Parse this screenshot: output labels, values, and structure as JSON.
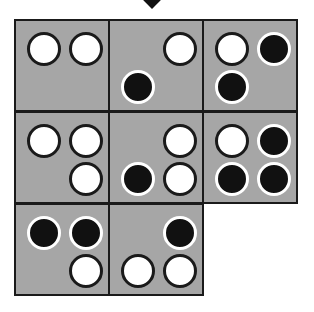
{
  "diagram": {
    "arrow": "down-arrow-icon",
    "colors": {
      "cell_bg": "#a6a6a6",
      "border": "#1a1a1a",
      "white_dot": "#ffffff",
      "black_dot": "#111111"
    },
    "cells": [
      {
        "row": 0,
        "col": 0,
        "dots": [
          {
            "pos": "tl",
            "color": "white"
          },
          {
            "pos": "tr",
            "color": "white"
          }
        ]
      },
      {
        "row": 0,
        "col": 1,
        "dots": [
          {
            "pos": "tr",
            "color": "white"
          },
          {
            "pos": "bl",
            "color": "black"
          }
        ]
      },
      {
        "row": 0,
        "col": 2,
        "dots": [
          {
            "pos": "tl",
            "color": "white"
          },
          {
            "pos": "tr",
            "color": "black"
          },
          {
            "pos": "bl",
            "color": "black"
          }
        ]
      },
      {
        "row": 1,
        "col": 0,
        "dots": [
          {
            "pos": "tl",
            "color": "white"
          },
          {
            "pos": "tr",
            "color": "white"
          },
          {
            "pos": "br",
            "color": "white"
          }
        ]
      },
      {
        "row": 1,
        "col": 1,
        "dots": [
          {
            "pos": "tr",
            "color": "white"
          },
          {
            "pos": "bl",
            "color": "black"
          },
          {
            "pos": "br",
            "color": "white"
          }
        ]
      },
      {
        "row": 1,
        "col": 2,
        "dots": [
          {
            "pos": "tl",
            "color": "white"
          },
          {
            "pos": "tr",
            "color": "black"
          },
          {
            "pos": "bl",
            "color": "black"
          },
          {
            "pos": "br",
            "color": "black"
          }
        ]
      },
      {
        "row": 2,
        "col": 0,
        "dots": [
          {
            "pos": "tl",
            "color": "black"
          },
          {
            "pos": "tr",
            "color": "black"
          },
          {
            "pos": "br",
            "color": "white"
          }
        ]
      },
      {
        "row": 2,
        "col": 1,
        "dots": [
          {
            "pos": "tr",
            "color": "black"
          },
          {
            "pos": "bl",
            "color": "white"
          },
          {
            "pos": "br",
            "color": "white"
          }
        ]
      }
    ]
  }
}
